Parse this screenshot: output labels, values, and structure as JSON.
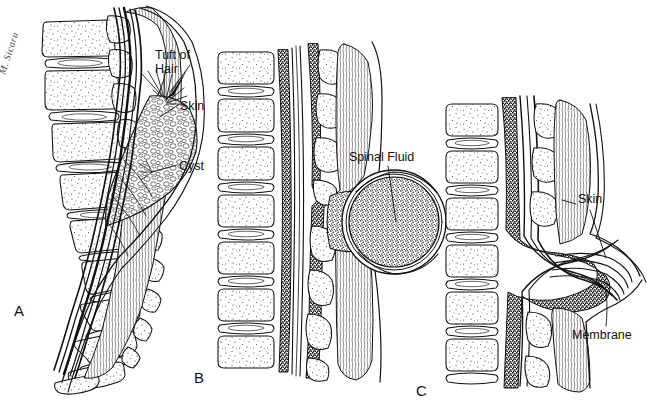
{
  "figure": {
    "background_color": "#ffffff",
    "ink_color": "#111111",
    "width": 650,
    "height": 412
  },
  "artist_signature": "M. Sicaru",
  "panels": [
    {
      "id": "A",
      "letter": "A",
      "name": "spina-bifida-occulta",
      "labels": [
        {
          "id": "tuft-of-hair",
          "text": "Tuft of\nHair"
        },
        {
          "id": "skin",
          "text": "Skin"
        },
        {
          "id": "cyst",
          "text": "Cyst"
        }
      ]
    },
    {
      "id": "B",
      "letter": "B",
      "name": "meningocele",
      "labels": [
        {
          "id": "spinal-fluid",
          "text": "Spinal Fluid"
        }
      ]
    },
    {
      "id": "C",
      "letter": "C",
      "name": "myelomeningocele",
      "labels": [
        {
          "id": "skin",
          "text": "Skin"
        },
        {
          "id": "membrane",
          "text": "Membrane"
        }
      ]
    }
  ],
  "labels": {
    "tuft_of_hair_line1": "Tuft of",
    "tuft_of_hair_line2": "Hair",
    "skin_a": "Skin",
    "cyst": "Cyst",
    "spinal_fluid": "Spinal Fluid",
    "skin_c": "Skin",
    "membrane": "Membrane",
    "letter_a": "A",
    "letter_b": "B",
    "letter_c": "C"
  }
}
